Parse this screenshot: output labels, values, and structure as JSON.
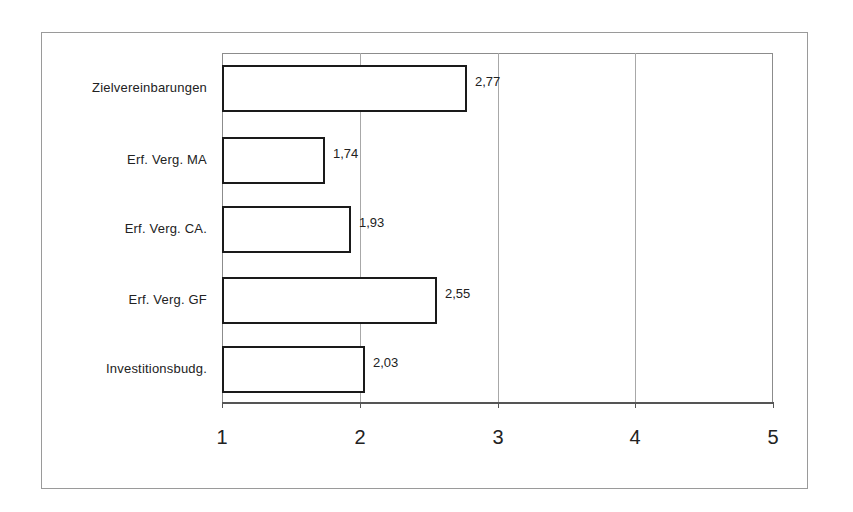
{
  "chart_data": {
    "type": "bar",
    "orientation": "horizontal",
    "title": "",
    "xlabel": "",
    "ylabel": "",
    "categories": [
      "Zielvereinbarungen",
      "Erf. Verg. MA",
      "Erf. Verg. CA.",
      "Erf. Verg. GF",
      "Investitionsbudg."
    ],
    "values": [
      2.77,
      1.74,
      1.93,
      2.55,
      2.03
    ],
    "value_labels": [
      "2,77",
      "1,74",
      "1,93",
      "2,55",
      "2,03"
    ],
    "xlim": [
      1,
      5
    ],
    "x_ticks": [
      "1",
      "2",
      "3",
      "4",
      "5"
    ],
    "grid": {
      "vertical": true,
      "horizontal": false
    },
    "legend": null,
    "bar_fill": "#ffffff",
    "bar_edge": "#1a1a1a"
  }
}
